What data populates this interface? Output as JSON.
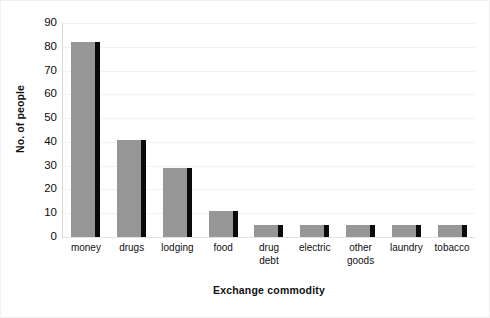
{
  "chart_data": {
    "type": "bar",
    "title": "",
    "xlabel": "Exchange commodity",
    "ylabel": "No. of people",
    "categories": [
      "money",
      "drugs",
      "lodging",
      "food",
      "drug debt",
      "electric",
      "other goods",
      "laundry",
      "tobacco"
    ],
    "category_lines": [
      [
        "money"
      ],
      [
        "drugs"
      ],
      [
        "lodging"
      ],
      [
        "food"
      ],
      [
        "drug",
        "debt"
      ],
      [
        "electric"
      ],
      [
        "other",
        "goods"
      ],
      [
        "laundry"
      ],
      [
        "tobacco"
      ]
    ],
    "values": [
      82,
      41,
      29,
      11,
      5,
      5,
      5,
      5,
      5
    ],
    "ylim": [
      0,
      90
    ],
    "yticks": [
      0,
      10,
      20,
      30,
      40,
      50,
      60,
      70,
      80,
      90
    ],
    "ytick_labels": [
      "0",
      "10",
      "20",
      "30",
      "40",
      "50",
      "60",
      "70",
      "80",
      "90"
    ],
    "grid": true,
    "legend": false,
    "bar_color": "#969696",
    "bar_shadow_color": "#0a0a0a",
    "gridline_color": "#f2f2f2",
    "axis_color": "#d9d9d9",
    "border_color": "#f0f0f0"
  }
}
